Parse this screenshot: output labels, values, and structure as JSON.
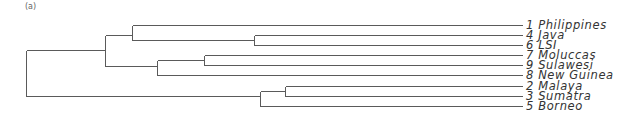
{
  "figure": {
    "panel_label": "(a)",
    "type": "dendrogram",
    "line_color": "#5a5a5a",
    "label_color": "#333333"
  },
  "leaves": [
    {
      "id": "1",
      "name": "Philippines",
      "label": "1 Philippines",
      "y": 25
    },
    {
      "id": "4",
      "name": "Java",
      "label": "4 Java",
      "y": 35
    },
    {
      "id": "6",
      "name": "LSI",
      "label": "6 LSI",
      "y": 45
    },
    {
      "id": "7",
      "name": "Moluccas",
      "label": "7 Moluccas",
      "y": 55
    },
    {
      "id": "9",
      "name": "Sulawesi",
      "label": "9 Sulawesi",
      "y": 65
    },
    {
      "id": "8",
      "name": "New Guinea",
      "label": "8 New Guinea",
      "y": 75
    },
    {
      "id": "2",
      "name": "Malaya",
      "label": "2 Malaya",
      "y": 86
    },
    {
      "id": "3",
      "name": "Sumatra",
      "label": "3 Sumatra",
      "y": 96
    },
    {
      "id": "5",
      "name": "Borneo",
      "label": "5 Borneo",
      "y": 106
    }
  ],
  "leaf_end_x": 522,
  "nodes": [
    {
      "name": "root",
      "x": 26,
      "y_top": 50,
      "y_bottom": 96
    },
    {
      "name": "node-a",
      "x": 105,
      "y_top": 35,
      "y_bottom": 66
    },
    {
      "name": "node-b",
      "x": 132,
      "y_top": 25,
      "y_bottom": 40
    },
    {
      "name": "node-java-lsi",
      "x": 254,
      "y_top": 35,
      "y_bottom": 45
    },
    {
      "name": "node-c",
      "x": 157,
      "y_top": 60,
      "y_bottom": 75
    },
    {
      "name": "node-moluccas-sulawesi",
      "x": 204,
      "y_top": 55,
      "y_bottom": 65
    },
    {
      "name": "node-d",
      "x": 260,
      "y_top": 91,
      "y_bottom": 106
    },
    {
      "name": "node-malaya-sumatra",
      "x": 285,
      "y_top": 86,
      "y_bottom": 96
    }
  ],
  "edges": [
    {
      "from_x": 26,
      "to_x": 105,
      "y": 50
    },
    {
      "from_x": 26,
      "to_x": 260,
      "y": 96
    },
    {
      "from_x": 105,
      "to_x": 132,
      "y": 35
    },
    {
      "from_x": 105,
      "to_x": 157,
      "y": 66
    },
    {
      "from_x": 132,
      "to_x": 522,
      "y": 25
    },
    {
      "from_x": 132,
      "to_x": 254,
      "y": 40
    },
    {
      "from_x": 254,
      "to_x": 522,
      "y": 35
    },
    {
      "from_x": 254,
      "to_x": 522,
      "y": 45
    },
    {
      "from_x": 157,
      "to_x": 204,
      "y": 60
    },
    {
      "from_x": 157,
      "to_x": 522,
      "y": 75
    },
    {
      "from_x": 204,
      "to_x": 522,
      "y": 55
    },
    {
      "from_x": 204,
      "to_x": 522,
      "y": 65
    },
    {
      "from_x": 260,
      "to_x": 285,
      "y": 91
    },
    {
      "from_x": 260,
      "to_x": 522,
      "y": 106
    },
    {
      "from_x": 285,
      "to_x": 522,
      "y": 86
    },
    {
      "from_x": 285,
      "to_x": 522,
      "y": 96
    }
  ]
}
